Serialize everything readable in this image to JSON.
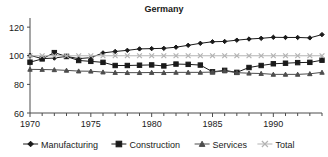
{
  "chart_data": {
    "type": "line",
    "title": "Germany",
    "xlabel": "",
    "ylabel": "",
    "xlim": [
      1970,
      1994
    ],
    "ylim": [
      60,
      125
    ],
    "yticks": [
      60,
      80,
      100,
      120
    ],
    "xticks": [
      1970,
      1975,
      1980,
      1985,
      1990
    ],
    "xminor_step": 1,
    "grid": false,
    "legend_position": "bottom",
    "x": [
      1970,
      1971,
      1972,
      1973,
      1974,
      1975,
      1976,
      1977,
      1978,
      1979,
      1980,
      1981,
      1982,
      1983,
      1984,
      1985,
      1986,
      1987,
      1988,
      1989,
      1990,
      1991,
      1992,
      1993,
      1994
    ],
    "series": [
      {
        "name": "Manufacturing",
        "marker": "diamond",
        "color": "#1a1a1a",
        "values": [
          100.3,
          98.0,
          98.4,
          99.6,
          98.0,
          98.7,
          102.0,
          103.0,
          103.8,
          104.8,
          105.0,
          105.2,
          106.0,
          107.3,
          108.7,
          109.8,
          110.0,
          110.9,
          111.7,
          112.2,
          112.9,
          112.8,
          112.8,
          112.5,
          114.8
        ]
      },
      {
        "name": "Construction",
        "marker": "square",
        "color": "#1a1a1a",
        "values": [
          95.5,
          97.8,
          102.2,
          99.5,
          96.7,
          96.1,
          95.4,
          93.2,
          93.2,
          93.4,
          93.6,
          92.9,
          94.2,
          94.0,
          93.5,
          88.8,
          89.8,
          88.4,
          91.8,
          93.2,
          94.4,
          94.8,
          95.2,
          95.4,
          96.9
        ]
      },
      {
        "name": "Services",
        "marker": "triangle",
        "color": "#4d4d4d",
        "values": [
          90.5,
          90.4,
          90.2,
          89.8,
          89.3,
          89.2,
          88.6,
          88.3,
          88.2,
          88.2,
          88.3,
          88.2,
          88.4,
          88.4,
          88.4,
          88.6,
          89.4,
          88.2,
          87.8,
          87.6,
          87.0,
          87.0,
          87.0,
          87.4,
          88.4
        ]
      },
      {
        "name": "Total",
        "marker": "x",
        "color": "#b3b3b3",
        "values": [
          100.0,
          100.0,
          100.0,
          100.0,
          100.0,
          100.0,
          100.0,
          100.0,
          100.0,
          100.0,
          100.0,
          100.0,
          100.0,
          100.0,
          100.0,
          100.0,
          100.0,
          100.0,
          100.0,
          100.0,
          100.0,
          100.0,
          100.0,
          100.0,
          100.0
        ]
      }
    ]
  },
  "legend": {
    "items": [
      {
        "label": "Manufacturing",
        "marker": "diamond-marker"
      },
      {
        "label": "Construction",
        "marker": "square-marker"
      },
      {
        "label": "Services",
        "marker": "triangle-marker"
      },
      {
        "label": "Total",
        "marker": "x-marker"
      }
    ]
  }
}
